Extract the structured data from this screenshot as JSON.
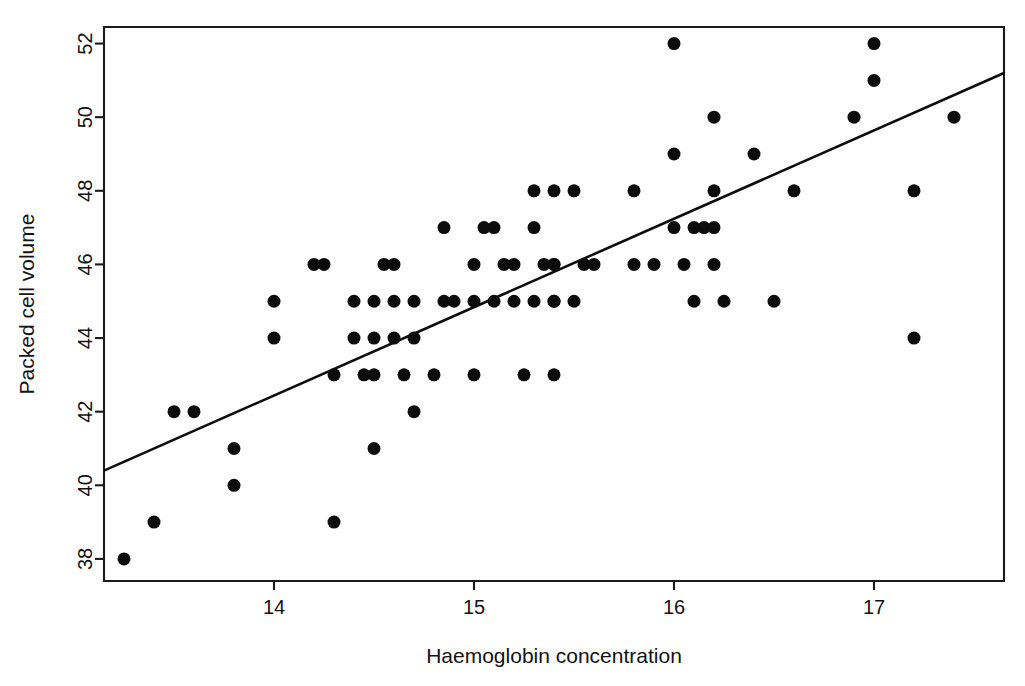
{
  "chart_data": {
    "type": "scatter",
    "title": "",
    "xlabel": "Haemoglobin concentration",
    "ylabel": "Packed cell volume",
    "xlim": [
      13.15,
      17.65
    ],
    "ylim": [
      37.4,
      52.45
    ],
    "xticks": [
      14,
      15,
      16,
      17
    ],
    "xtick_labels": [
      "14",
      "15",
      "16",
      "17"
    ],
    "yticks": [
      38,
      40,
      42,
      44,
      46,
      48,
      50,
      52
    ],
    "ytick_labels": [
      "38",
      "40",
      "42",
      "44",
      "46",
      "48",
      "50",
      "52"
    ],
    "grid": false,
    "legend": null,
    "point_marker": "filled-circle",
    "point_color": "#0c0c0c",
    "point_radius": 6.5,
    "line_color": "#0c0c0c",
    "x": [
      13.25,
      13.4,
      13.5,
      13.6,
      13.8,
      13.8,
      14.0,
      14.0,
      14.2,
      14.25,
      14.3,
      14.3,
      14.4,
      14.4,
      14.45,
      14.5,
      14.5,
      14.5,
      14.5,
      14.55,
      14.6,
      14.6,
      14.6,
      14.65,
      14.7,
      14.7,
      14.7,
      14.8,
      14.85,
      14.85,
      14.9,
      15.0,
      15.0,
      15.0,
      15.05,
      15.1,
      15.1,
      15.15,
      15.2,
      15.2,
      15.25,
      15.3,
      15.3,
      15.3,
      15.35,
      15.4,
      15.4,
      15.4,
      15.4,
      15.4,
      15.4,
      15.5,
      15.5,
      15.55,
      15.6,
      15.8,
      15.8,
      15.9,
      16.0,
      16.0,
      16.0,
      16.05,
      16.1,
      16.1,
      16.15,
      16.2,
      16.2,
      16.2,
      16.2,
      16.25,
      16.4,
      16.5,
      16.6,
      16.9,
      17.0,
      17.0,
      17.2,
      17.2,
      17.4
    ],
    "y": [
      38,
      39,
      42,
      42,
      41,
      40,
      45,
      44,
      46,
      46,
      43,
      39,
      45,
      44,
      43,
      45,
      44,
      43,
      41,
      46,
      46,
      45,
      44,
      43,
      45,
      44,
      42,
      43,
      47,
      45,
      45,
      46,
      45,
      43,
      47,
      47,
      45,
      46,
      46,
      45,
      43,
      48,
      47,
      45,
      46,
      48,
      46,
      45,
      43,
      45,
      46,
      48,
      45,
      46,
      46,
      48,
      46,
      46,
      52,
      49,
      47,
      46,
      47,
      45,
      47,
      50,
      48,
      47,
      46,
      45,
      49,
      45,
      48,
      50,
      52,
      51,
      48,
      44,
      50
    ],
    "regression_line": {
      "x_start": 13.15,
      "y_start": 40.4,
      "x_end": 17.65,
      "y_end": 51.2,
      "slope": 2.4,
      "intercept": 8.84
    }
  },
  "axes": {
    "x_title": "Haemoglobin concentration",
    "y_title": "Packed cell volume"
  },
  "plot_box": {
    "left": 104,
    "top": 27,
    "right": 1004,
    "bottom": 581
  }
}
